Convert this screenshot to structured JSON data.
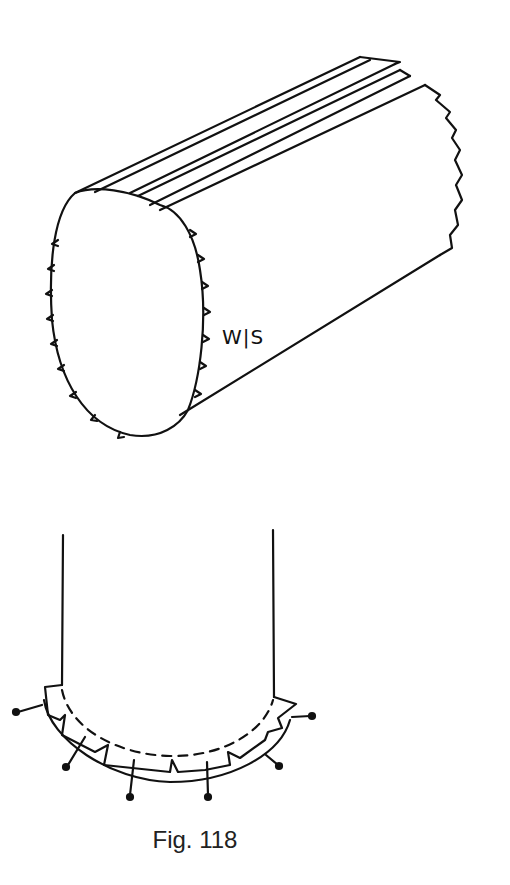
{
  "figure": {
    "caption": "Fig. 118",
    "top_illustration": {
      "description": "tube of fabric, wrong side out, with pinked/notched raw edges and folded top seam",
      "label": "W|S"
    },
    "bottom_illustration": {
      "description": "curved hem/seam with notched seam allowance and pins around the curve"
    }
  }
}
